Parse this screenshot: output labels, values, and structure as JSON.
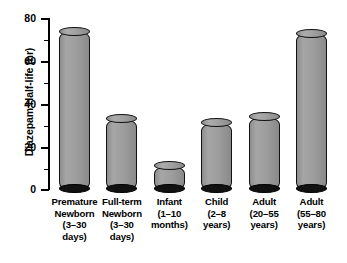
{
  "chart_data": {
    "type": "bar",
    "title": "",
    "xlabel": "",
    "ylabel": "Diazepam Half-life (hr)",
    "ylim": [
      0,
      80
    ],
    "ytick_labels": [
      "0",
      "20",
      "40",
      "60",
      "80"
    ],
    "ytick_values": [
      0,
      20,
      40,
      60,
      80
    ],
    "minor_tick_values": [
      10,
      30,
      50,
      70
    ],
    "grid": false,
    "legend": "none",
    "categories": [
      "Premature Newborn (3–30 days)",
      "Full-term Newborn (3–30 days)",
      "Infant (1–10 months)",
      "Child (2–8 years)",
      "Adult (20–55 years)",
      "Adult (55–80 years)"
    ],
    "category_label_lines": [
      [
        "Premature",
        "Newborn",
        "(3–30",
        "days)"
      ],
      [
        "Full-term",
        "Newborn",
        "(3–30",
        "days)"
      ],
      [
        "Infant",
        "(1–10",
        "months)"
      ],
      [
        "Child",
        "(2–8",
        "years)"
      ],
      [
        "Adult",
        "(20–55",
        "years)"
      ],
      [
        "Adult",
        "(55–80",
        "years)"
      ]
    ],
    "values": [
      74,
      33,
      11,
      31,
      34,
      73
    ],
    "bar_style": "cylinder",
    "colors": {
      "bar_fill": "#9c9c9c",
      "bar_outline": "#111111",
      "bar_base": "#111111",
      "axis": "#000000",
      "text": "#000000",
      "background": "#ffffff"
    }
  }
}
